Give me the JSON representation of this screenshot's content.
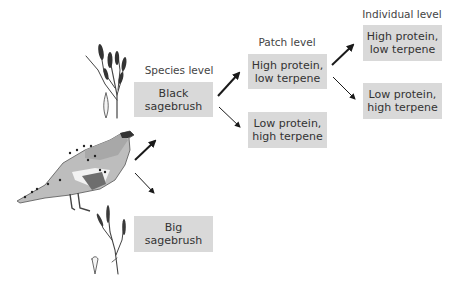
{
  "levels": {
    "species": "Species level",
    "patch": "Patch level",
    "individual": "Individual level"
  },
  "species_boxes": [
    {
      "line1": "Black",
      "line2": "sagebrush"
    },
    {
      "line1": "Big",
      "line2": "sagebrush"
    }
  ],
  "patch_boxes": [
    {
      "line1": "High protein,",
      "line2": "low terpene"
    },
    {
      "line1": "Low protein,",
      "line2": "high terpene"
    }
  ],
  "individual_boxes": [
    {
      "line1": "High protein,",
      "line2": "low terpene"
    },
    {
      "line1": "Low protein,",
      "line2": "high terpene"
    }
  ],
  "colors": {
    "box_fill": "#d9d9d9",
    "arrow": "#1a1a1a"
  }
}
